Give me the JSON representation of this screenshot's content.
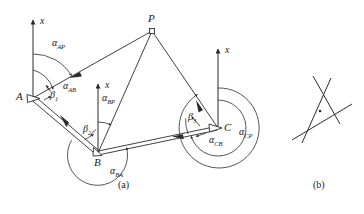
{
  "figure": {
    "caption_a": "(a)",
    "caption_b": "(b)",
    "stroke_color": "#2b2b2b",
    "background_color": "#ffffff"
  },
  "panel_a": {
    "points": [
      {
        "name": "point-A",
        "label": "A",
        "x": 33,
        "y": 98
      },
      {
        "name": "point-B",
        "label": "B",
        "x": 98,
        "y": 153
      },
      {
        "name": "point-C",
        "label": "C",
        "x": 218,
        "y": 128
      },
      {
        "name": "point-P",
        "label": "P",
        "x": 152,
        "y": 31
      }
    ],
    "axis_labels": [
      {
        "name": "axis-label-x-at-A",
        "label": "x",
        "x": 48,
        "y": 20
      },
      {
        "name": "axis-label-x-at-B",
        "label": "x",
        "x": 113,
        "y": 84
      },
      {
        "name": "axis-label-x-at-C",
        "label": "x",
        "x": 233,
        "y": 49
      }
    ],
    "angle_labels": [
      {
        "name": "angle-alpha-AP",
        "symbol": "α",
        "sub": "AP",
        "x": 56,
        "y": 44
      },
      {
        "name": "angle-alpha-AB",
        "symbol": "α",
        "sub": "AB",
        "x": 66,
        "y": 86
      },
      {
        "name": "angle-beta-1",
        "symbol": "β",
        "sub": "1",
        "x": 51,
        "y": 95
      },
      {
        "name": "angle-alpha-BP",
        "symbol": "α",
        "sub": "BP",
        "x": 105,
        "y": 98
      },
      {
        "name": "angle-beta-2",
        "symbol": "β",
        "sub": "2",
        "x": 86,
        "y": 130
      },
      {
        "name": "angle-alpha-BA",
        "symbol": "α",
        "sub": "BA",
        "x": 111,
        "y": 171
      },
      {
        "name": "angle-beta-3",
        "symbol": "β",
        "sub": "3",
        "x": 190,
        "y": 117
      },
      {
        "name": "angle-alpha-CB",
        "symbol": "α",
        "sub": "CB",
        "x": 211,
        "y": 140
      },
      {
        "name": "angle-alpha-CP",
        "symbol": "α",
        "sub": "CP",
        "x": 240,
        "y": 132
      }
    ]
  },
  "panel_b": {
    "description": "three intersecting lines forming small error triangle with point"
  }
}
